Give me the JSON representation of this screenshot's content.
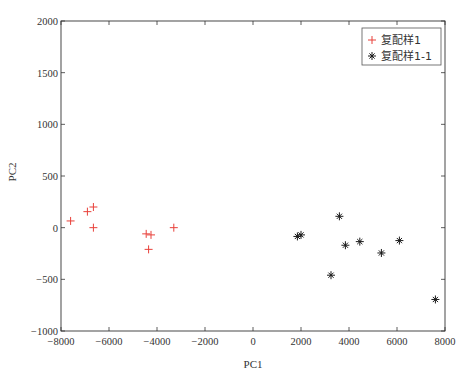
{
  "chart_data": {
    "type": "scatter",
    "title": "",
    "xlabel": "PC1",
    "ylabel": "PC2",
    "xlim": [
      -8000,
      8000
    ],
    "ylim": [
      -1000,
      2000
    ],
    "xticks": [
      -8000,
      -6000,
      -4000,
      -2000,
      0,
      2000,
      4000,
      6000,
      8000
    ],
    "yticks": [
      -1000,
      -500,
      0,
      500,
      1000,
      1500,
      2000
    ],
    "xtick_labels": [
      "−8000",
      "−6000",
      "−4000",
      "−2000",
      "0",
      "2000",
      "4000",
      "6000",
      "8000"
    ],
    "ytick_labels": [
      "−1000",
      "−500",
      "0",
      "500",
      "1000",
      "1500",
      "2000"
    ],
    "grid": false,
    "legend_position": "upper right",
    "series": [
      {
        "name": "复配样1",
        "marker": "+",
        "color": "#e8403a",
        "points": [
          [
            -7600,
            65
          ],
          [
            -6900,
            155
          ],
          [
            -6650,
            200
          ],
          [
            -6650,
            0
          ],
          [
            -4450,
            -60
          ],
          [
            -4250,
            -70
          ],
          [
            -4350,
            -210
          ],
          [
            -3300,
            0
          ]
        ]
      },
      {
        "name": "复配样1-1",
        "marker": "*",
        "color": "#1a1a1a",
        "points": [
          [
            1850,
            -85
          ],
          [
            2000,
            -70
          ],
          [
            3600,
            110
          ],
          [
            3850,
            -170
          ],
          [
            4450,
            -135
          ],
          [
            3250,
            -460
          ],
          [
            5350,
            -245
          ],
          [
            6100,
            -125
          ],
          [
            7600,
            -695
          ]
        ]
      }
    ]
  }
}
